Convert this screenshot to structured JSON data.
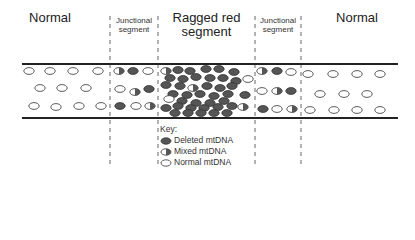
{
  "labels": {
    "normal_left": "Normal",
    "junctional_left_line1": "Junctional",
    "junctional_left_line2": "segment",
    "ragged_red_line1": "Ragged red",
    "ragged_red_line2": "segment",
    "junctional_right_line1": "Junctional",
    "junctional_right_line2": "segment",
    "normal_right": "Normal"
  },
  "key": {
    "title": "Key:",
    "items": [
      {
        "type": "deleted",
        "label": "Deleted mtDNA"
      },
      {
        "type": "mixed",
        "label": "Mixed mtDNA"
      },
      {
        "type": "normal",
        "label": "Normal mtDNA"
      }
    ]
  },
  "colors": {
    "deleted_fill": "#555555",
    "normal_fill": "#ffffff",
    "outline": "#333333",
    "line": "#222222"
  }
}
